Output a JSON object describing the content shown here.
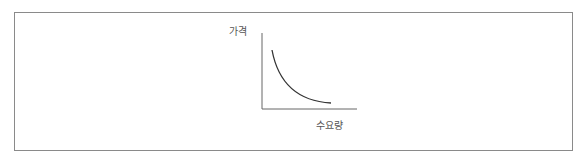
{
  "diagram": {
    "title": "",
    "y_axis_label": "가격",
    "x_axis_label": "수요량",
    "curve": "demand-curve",
    "colors": {
      "frame": "#8a8a8a",
      "axis": "#666666",
      "curve": "#333333",
      "text": "#555555"
    }
  }
}
